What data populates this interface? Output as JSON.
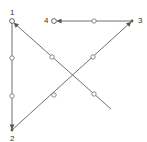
{
  "diagram": {
    "type": "path-sequence",
    "colors": {
      "line": "#707070",
      "node_fill": "#ffffff",
      "label": "#333333"
    },
    "nodes": [
      {
        "id": "1",
        "label": "1",
        "x": 12,
        "y": 21
      },
      {
        "id": "2",
        "label": "2",
        "x": 12,
        "y": 130
      },
      {
        "id": "3",
        "label": "3",
        "x": 132,
        "y": 21
      },
      {
        "id": "4",
        "label": "4",
        "x": 54,
        "y": 21
      }
    ],
    "edges": [
      {
        "from": "start",
        "to": "1",
        "x1": 111,
        "y1": 109,
        "x2": 12,
        "y2": 21,
        "waypoints": [
          [
            94,
            94
          ],
          [
            52,
            57
          ]
        ]
      },
      {
        "from": "1",
        "to": "2",
        "x1": 12,
        "y1": 21,
        "x2": 12,
        "y2": 130,
        "waypoints": [
          [
            12,
            58
          ],
          [
            12,
            96
          ]
        ]
      },
      {
        "from": "2",
        "to": "3",
        "x1": 12,
        "y1": 130,
        "x2": 132,
        "y2": 21,
        "waypoints": [
          [
            54,
            95
          ],
          [
            93,
            57
          ]
        ]
      },
      {
        "from": "3",
        "to": "4",
        "x1": 132,
        "y1": 21,
        "x2": 56,
        "y2": 21,
        "waypoints": [
          [
            94,
            21
          ]
        ]
      }
    ]
  }
}
